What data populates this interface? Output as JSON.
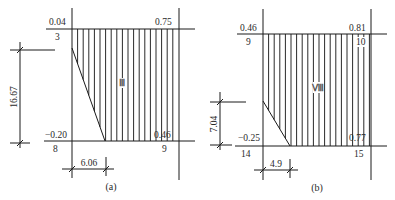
{
  "figures": [
    {
      "id": "a",
      "caption": "(a)",
      "region_label": "Ⅲ",
      "top_left_value": "0.04",
      "top_right_value": "0.75",
      "bottom_left_value": "−0.20",
      "bottom_right_value": "0.46",
      "node_top_left": "3",
      "node_bottom_left": "8",
      "node_bottom_right": "9",
      "vertical_dimension": "16.67",
      "horizontal_dimension": "6.06"
    },
    {
      "id": "b",
      "caption": "(b)",
      "region_label": "Ⅷ",
      "top_left_value": "0.46",
      "top_right_value": "0.81",
      "bottom_left_value": "−0.25",
      "bottom_right_value": "0.77",
      "node_top_left": "9",
      "node_top_right": "10",
      "node_bottom_left": "14",
      "node_bottom_right": "15",
      "vertical_dimension": "7.04",
      "horizontal_dimension": "4.9"
    }
  ]
}
